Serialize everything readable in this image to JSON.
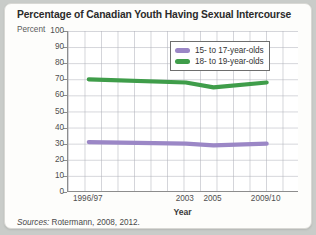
{
  "card": {
    "title": "Percentage of Canadian Youth Having Sexual Intercourse",
    "percent_axis_label": "Percent",
    "sources_prefix": "Sources:",
    "sources_body": "Rotermann, 2008, 2012."
  },
  "legend": {
    "position": "inside-top-right",
    "items": [
      {
        "label": "15- to 17-year-olds",
        "color": "#9b87c6",
        "name": "legend-item-15-17"
      },
      {
        "label": "18- to 19-year-olds",
        "color": "#3f9d4a",
        "name": "legend-item-18-19"
      }
    ]
  },
  "chart_data": {
    "type": "line",
    "title": "Percentage of Canadian Youth Having Sexual Intercourse",
    "xlabel": "Year",
    "ylabel": "Percent",
    "ylim": [
      0,
      100
    ],
    "ytick_step": 10,
    "yticks": [
      100,
      90,
      80,
      70,
      60,
      50,
      40,
      30,
      20,
      10,
      0
    ],
    "grid": true,
    "categories": [
      "1996/97",
      "2003",
      "2005",
      "2009/10"
    ],
    "x_positions_pct": [
      9,
      51,
      63,
      86
    ],
    "series": [
      {
        "name": "15- to 17-year-olds",
        "color": "#9b87c6",
        "values": [
          31,
          30,
          29,
          30
        ]
      },
      {
        "name": "18- to 19-year-olds",
        "color": "#3f9d4a",
        "values": [
          70,
          68,
          65,
          68
        ]
      }
    ]
  }
}
